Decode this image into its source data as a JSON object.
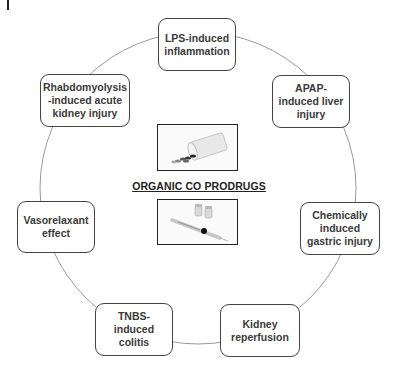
{
  "diagram": {
    "center_title": "ORGANIC CO PRODRUGS",
    "center_images": [
      {
        "name": "pill-bottle-image",
        "description": "spilled pill bottle"
      },
      {
        "name": "syringe-vials-image",
        "description": "syringe with vials"
      }
    ],
    "nodes": [
      {
        "id": "lps",
        "label": "LPS-induced\ninflammation"
      },
      {
        "id": "apap",
        "label": "APAP-\ninduced liver\ninjury"
      },
      {
        "id": "gastric",
        "label": "Chemically\ninduced\ngastric injury"
      },
      {
        "id": "kidney-reperfusion",
        "label": "Kidney\nreperfusion"
      },
      {
        "id": "tnbs",
        "label": "TNBS-\ninduced colitis"
      },
      {
        "id": "vasorelaxant",
        "label": "Vasorelaxant\neffect"
      },
      {
        "id": "rhabdo",
        "label": "Rhabdomyolysis\n-induced acute\nkidney injury"
      }
    ],
    "colors": {
      "ring": "#9a9a9a",
      "node_border": "#444444",
      "node_text": "#3a3a3a",
      "center_text": "#222222"
    }
  }
}
